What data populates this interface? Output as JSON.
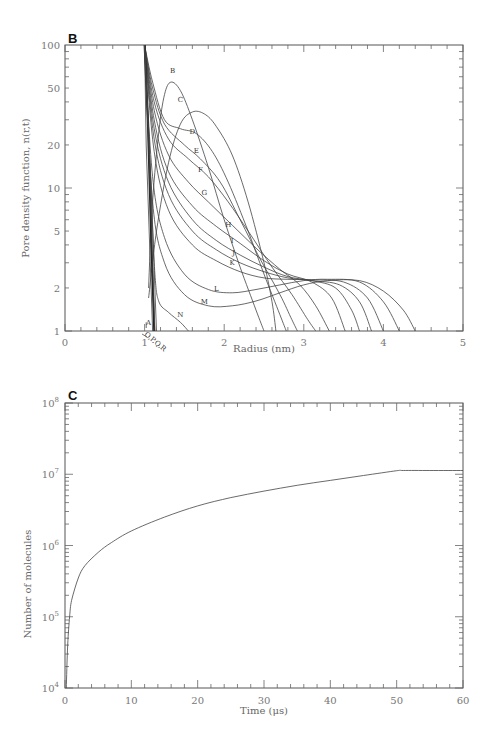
{
  "chart_data": [
    {
      "panel": "B",
      "type": "line",
      "title": "",
      "xlabel": "Radius (nm)",
      "ylabel": "Pore density function, n(r,t)",
      "xlim": [
        0,
        5
      ],
      "ylim": [
        1,
        100
      ],
      "yscale": "log",
      "xticks": [
        "0",
        "1",
        "2",
        "3",
        "4",
        "5"
      ],
      "yticks": [
        "1",
        "2",
        "5",
        "10",
        "20",
        "50",
        "100"
      ],
      "grid": false,
      "annotation": "O,P,Q,R",
      "series": [
        {
          "name": "A",
          "points": [
            [
              1.02,
              1.05
            ],
            [
              1.02,
              1.15
            ]
          ]
        },
        {
          "name": "B",
          "points": [
            [
              1.05,
              2
            ],
            [
              1.1,
              8
            ],
            [
              1.18,
              25
            ],
            [
              1.25,
              45
            ],
            [
              1.33,
              55
            ],
            [
              1.45,
              48
            ],
            [
              1.6,
              30
            ],
            [
              1.8,
              14
            ],
            [
              2.0,
              6
            ],
            [
              2.2,
              2.8
            ],
            [
              2.4,
              1.4
            ],
            [
              2.5,
              1.0
            ]
          ]
        },
        {
          "name": "C",
          "points": [
            [
              1.05,
              1.7
            ],
            [
              1.15,
              5
            ],
            [
              1.3,
              15
            ],
            [
              1.45,
              28
            ],
            [
              1.6,
              34
            ],
            [
              1.75,
              33
            ],
            [
              1.9,
              27
            ],
            [
              2.1,
              17
            ],
            [
              2.3,
              8
            ],
            [
              2.5,
              3
            ],
            [
              2.6,
              1.6
            ],
            [
              2.65,
              1.0
            ]
          ]
        },
        {
          "name": "D",
          "points": [
            [
              1.0,
              100
            ],
            [
              1.1,
              55
            ],
            [
              1.25,
              30
            ],
            [
              1.45,
              26
            ],
            [
              1.65,
              24
            ],
            [
              1.85,
              18
            ],
            [
              2.05,
              11
            ],
            [
              2.3,
              5
            ],
            [
              2.5,
              2.5
            ],
            [
              2.7,
              1.3
            ],
            [
              2.78,
              1.0
            ]
          ]
        },
        {
          "name": "E",
          "points": [
            [
              1.0,
              100
            ],
            [
              1.1,
              50
            ],
            [
              1.25,
              28
            ],
            [
              1.5,
              20
            ],
            [
              1.7,
              16
            ],
            [
              1.95,
              11
            ],
            [
              2.2,
              6
            ],
            [
              2.45,
              3.2
            ],
            [
              2.7,
              1.8
            ],
            [
              2.85,
              1.2
            ],
            [
              2.92,
              1.0
            ]
          ]
        },
        {
          "name": "F",
          "points": [
            [
              1.0,
              100
            ],
            [
              1.12,
              40
            ],
            [
              1.3,
              22
            ],
            [
              1.55,
              16
            ],
            [
              1.8,
              12
            ],
            [
              2.05,
              8
            ],
            [
              2.3,
              5
            ],
            [
              2.6,
              2.8
            ],
            [
              2.85,
              1.8
            ],
            [
              3.05,
              1.2
            ],
            [
              3.15,
              1.0
            ]
          ]
        },
        {
          "name": "G",
          "points": [
            [
              1.0,
              100
            ],
            [
              1.12,
              35
            ],
            [
              1.3,
              17
            ],
            [
              1.55,
              11
            ],
            [
              1.8,
              8
            ],
            [
              2.1,
              5.5
            ],
            [
              2.4,
              3.8
            ],
            [
              2.7,
              2.7
            ],
            [
              2.95,
              2.1
            ],
            [
              3.15,
              1.5
            ],
            [
              3.32,
              1.0
            ]
          ]
        },
        {
          "name": "H",
          "points": [
            [
              1.0,
              100
            ],
            [
              1.12,
              30
            ],
            [
              1.3,
              13
            ],
            [
              1.6,
              7.5
            ],
            [
              1.9,
              5.4
            ],
            [
              2.2,
              4.1
            ],
            [
              2.5,
              3.1
            ],
            [
              2.8,
              2.5
            ],
            [
              3.1,
              2.2
            ],
            [
              3.35,
              1.7
            ],
            [
              3.52,
              1.0
            ]
          ]
        },
        {
          "name": "I",
          "points": [
            [
              1.0,
              100
            ],
            [
              1.12,
              26
            ],
            [
              1.3,
              11
            ],
            [
              1.6,
              6
            ],
            [
              1.9,
              4.3
            ],
            [
              2.2,
              3.4
            ],
            [
              2.5,
              2.8
            ],
            [
              2.8,
              2.4
            ],
            [
              3.1,
              2.25
            ],
            [
              3.4,
              2.0
            ],
            [
              3.6,
              1.4
            ],
            [
              3.7,
              1.0
            ]
          ]
        },
        {
          "name": "J",
          "points": [
            [
              1.0,
              100
            ],
            [
              1.12,
              22
            ],
            [
              1.3,
              9
            ],
            [
              1.6,
              5
            ],
            [
              1.9,
              3.7
            ],
            [
              2.2,
              3.0
            ],
            [
              2.5,
              2.6
            ],
            [
              2.8,
              2.35
            ],
            [
              3.1,
              2.25
            ],
            [
              3.45,
              2.1
            ],
            [
              3.7,
              1.6
            ],
            [
              3.85,
              1.0
            ]
          ]
        },
        {
          "name": "K",
          "points": [
            [
              1.0,
              100
            ],
            [
              1.12,
              18
            ],
            [
              1.3,
              7
            ],
            [
              1.6,
              4
            ],
            [
              1.9,
              3.1
            ],
            [
              2.2,
              2.6
            ],
            [
              2.5,
              2.35
            ],
            [
              2.8,
              2.3
            ],
            [
              3.1,
              2.28
            ],
            [
              3.5,
              2.2
            ],
            [
              3.8,
              1.7
            ],
            [
              4.0,
              1.0
            ]
          ]
        },
        {
          "name": "L",
          "points": [
            [
              1.0,
              100
            ],
            [
              1.1,
              12
            ],
            [
              1.25,
              4.5
            ],
            [
              1.5,
              2.5
            ],
            [
              1.8,
              1.95
            ],
            [
              2.1,
              1.85
            ],
            [
              2.4,
              1.95
            ],
            [
              2.7,
              2.1
            ],
            [
              3.0,
              2.25
            ],
            [
              3.3,
              2.3
            ],
            [
              3.7,
              2.2
            ],
            [
              4.0,
              1.6
            ],
            [
              4.2,
              1.0
            ]
          ]
        },
        {
          "name": "M",
          "points": [
            [
              1.0,
              100
            ],
            [
              1.1,
              8
            ],
            [
              1.25,
              3
            ],
            [
              1.5,
              1.8
            ],
            [
              1.8,
              1.5
            ],
            [
              2.1,
              1.5
            ],
            [
              2.4,
              1.62
            ],
            [
              2.7,
              1.85
            ],
            [
              3.0,
              2.1
            ],
            [
              3.3,
              2.25
            ],
            [
              3.7,
              2.25
            ],
            [
              4.0,
              1.9
            ],
            [
              4.25,
              1.4
            ],
            [
              4.4,
              1.0
            ]
          ]
        },
        {
          "name": "N",
          "points": [
            [
              1.0,
              100
            ],
            [
              1.08,
              10
            ],
            [
              1.13,
              2.5
            ],
            [
              1.18,
              1.6
            ],
            [
              1.3,
              1.35
            ],
            [
              1.45,
              1.15
            ],
            [
              1.55,
              1.0
            ]
          ]
        },
        {
          "name": "O,P,Q,R",
          "points": [
            [
              1.0,
              100
            ],
            [
              1.04,
              30
            ],
            [
              1.08,
              5
            ],
            [
              1.12,
              1.0
            ]
          ]
        }
      ]
    },
    {
      "panel": "C",
      "type": "line",
      "title": "",
      "xlabel": "Time (μs)",
      "ylabel": "Number of molecules",
      "xlim": [
        0,
        60
      ],
      "ylim": [
        10000,
        100000000
      ],
      "yscale": "log",
      "xticks": [
        "0",
        "10",
        "20",
        "30",
        "40",
        "50",
        "60"
      ],
      "yticks": [
        "10^4",
        "10^5",
        "10^6",
        "10^7",
        "10^8"
      ],
      "grid": false,
      "series": [
        {
          "name": "molecules",
          "x": [
            0.2,
            0.4,
            0.7,
            1,
            2,
            3,
            5,
            7,
            10,
            15,
            20,
            25,
            30,
            35,
            40,
            45,
            50,
            51,
            55,
            60
          ],
          "y": [
            10000,
            40000,
            100000,
            170000,
            350000,
            520000,
            800000,
            1100000,
            1600000,
            2500000,
            3600000,
            4700000,
            5800000,
            7000000,
            8200000,
            9600000,
            11200000,
            11300000,
            11300000,
            11300000
          ]
        }
      ]
    }
  ],
  "panels": {
    "b": {
      "label": "B",
      "xlabel": "Radius (nm)",
      "ylabel": "Pore density function, n(r,t)",
      "annotation": "O,P,Q,R"
    },
    "c": {
      "label": "C",
      "xlabel": "Time (μs)",
      "ylabel": "Number of molecules"
    }
  }
}
